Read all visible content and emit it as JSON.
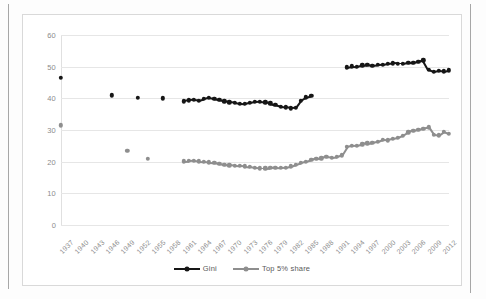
{
  "chart_data": {
    "type": "scatter",
    "title": "",
    "subtitle": "",
    "xlabel": "",
    "ylabel": "",
    "grid": true,
    "legend_position": "bottom",
    "ylim": [
      0,
      60
    ],
    "yticks": [
      0,
      10,
      20,
      30,
      40,
      50,
      60
    ],
    "xlim": [
      1937,
      2013
    ],
    "xticks": [
      1937,
      1940,
      1943,
      1946,
      1949,
      1952,
      1955,
      1958,
      1961,
      1964,
      1967,
      1970,
      1973,
      1976,
      1979,
      1982,
      1985,
      1988,
      1991,
      1994,
      1997,
      2000,
      2003,
      2006,
      2009,
      2012
    ],
    "colors": {
      "gini": "#161616",
      "top5": "#8e8e8e",
      "grid": "#e6e6e6",
      "axis_text": "#8c8c8c"
    },
    "series": [
      {
        "name": "Gini",
        "color": "#161616",
        "x": [
          1937,
          1947,
          1952,
          1957,
          1961,
          1962,
          1963,
          1964,
          1965,
          1966,
          1967,
          1968,
          1969,
          1970,
          1971,
          1972,
          1973,
          1974,
          1975,
          1976,
          1977,
          1978,
          1979,
          1980,
          1981,
          1982,
          1983,
          1984,
          1985,
          1986,
          1993,
          1994,
          1995,
          1996,
          1997,
          1998,
          1999,
          2000,
          2001,
          2002,
          2003,
          2004,
          2005,
          2006,
          2007,
          2008,
          2009,
          2010,
          2011,
          2012,
          2013
        ],
        "values": [
          46.5,
          41.0,
          40.2,
          40.0,
          39.1,
          39.4,
          39.5,
          39.3,
          39.8,
          40.2,
          39.9,
          39.5,
          39.1,
          38.8,
          38.6,
          38.3,
          38.2,
          38.6,
          38.9,
          39.0,
          38.8,
          38.4,
          37.9,
          37.4,
          37.2,
          36.9,
          37.0,
          39.2,
          40.3,
          40.8,
          49.8,
          50.1,
          50.0,
          50.4,
          50.6,
          50.3,
          50.5,
          50.6,
          50.9,
          51.1,
          51.0,
          51.0,
          51.3,
          51.2,
          51.5,
          52.0,
          49.1,
          48.4,
          48.7,
          48.5,
          48.9
        ]
      },
      {
        "name": "Top 5% share",
        "color": "#8e8e8e",
        "x": [
          1937,
          1950,
          1954,
          1961,
          1962,
          1963,
          1964,
          1965,
          1966,
          1967,
          1968,
          1969,
          1970,
          1971,
          1972,
          1973,
          1974,
          1975,
          1976,
          1977,
          1978,
          1979,
          1980,
          1981,
          1982,
          1983,
          1984,
          1985,
          1986,
          1987,
          1988,
          1989,
          1990,
          1991,
          1992,
          1993,
          1994,
          1995,
          1996,
          1997,
          1998,
          1999,
          2000,
          2001,
          2002,
          2003,
          2004,
          2005,
          2006,
          2007,
          2008,
          2009,
          2010,
          2011,
          2012,
          2013
        ],
        "values": [
          31.5,
          23.5,
          21.0,
          20.1,
          20.2,
          20.3,
          20.1,
          20.0,
          19.8,
          19.7,
          19.4,
          19.1,
          18.9,
          18.7,
          18.6,
          18.5,
          18.3,
          18.0,
          17.9,
          17.9,
          18.0,
          18.1,
          18.0,
          18.1,
          18.5,
          19.1,
          19.6,
          20.0,
          20.5,
          21.0,
          21.1,
          21.5,
          21.3,
          21.5,
          22.0,
          24.6,
          25.0,
          25.1,
          25.5,
          25.8,
          26.0,
          26.3,
          26.9,
          26.8,
          27.2,
          27.5,
          28.2,
          29.3,
          29.8,
          30.1,
          30.4,
          30.9,
          28.5,
          28.3,
          29.5,
          28.8
        ]
      }
    ]
  },
  "legend": {
    "items": [
      {
        "label": "Gini",
        "color": "#161616"
      },
      {
        "label": "Top 5% share",
        "color": "#8e8e8e"
      }
    ]
  }
}
